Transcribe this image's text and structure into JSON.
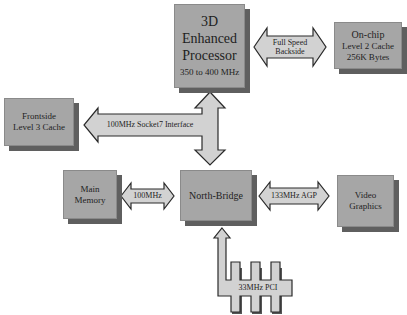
{
  "diagram": {
    "nodes": {
      "processor": {
        "lines": [
          "3D",
          "Enhanced",
          "Processor"
        ],
        "sub": "350 to 400 MHz"
      },
      "l2_cache": {
        "lines": [
          "On-chip",
          "Level 2 Cache",
          "256K Bytes"
        ]
      },
      "l3_cache": {
        "lines": [
          "Frontside",
          "Level 3 Cache"
        ]
      },
      "main_memory": {
        "lines": [
          "Main",
          "Memory"
        ]
      },
      "north_bridge": {
        "label": "North-Bridge"
      },
      "video_graphics": {
        "lines": [
          "Video",
          "Graphics"
        ]
      }
    },
    "connectors": {
      "backside": {
        "lines": [
          "Full Speed",
          "Backside"
        ],
        "from": "processor",
        "to": "l2_cache"
      },
      "socket7": {
        "label": "100MHz Socket7 Interface",
        "from": "processor/north_bridge",
        "to": "l3_cache"
      },
      "memory_bus": {
        "label": "100MHz",
        "from": "north_bridge",
        "to": "main_memory"
      },
      "agp": {
        "label": "133MHz AGP",
        "from": "north_bridge",
        "to": "video_graphics"
      },
      "pci": {
        "label": "33MHz PCI",
        "from": "pci_slots",
        "to": "north_bridge"
      }
    },
    "colors": {
      "box_fill": "#a6a6a6",
      "box_shadow": "#5f5f5f",
      "arrow_fill": "#d2d2d2",
      "arrow_stroke": "#2a2a2a",
      "text": "#1e1e1e"
    }
  }
}
